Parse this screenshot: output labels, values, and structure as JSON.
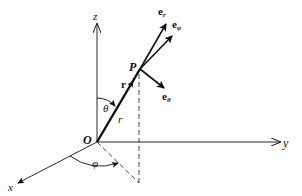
{
  "diagram": {
    "type": "spherical-coordinates",
    "axes": {
      "x": {
        "label": "x"
      },
      "y": {
        "label": "y"
      },
      "z": {
        "label": "z"
      }
    },
    "points": {
      "origin": {
        "label": "O"
      },
      "point": {
        "label": "P"
      }
    },
    "vectors": {
      "position": {
        "label": "r"
      },
      "radius_length": {
        "label": "r"
      },
      "e_r": {
        "base": "e",
        "sub": "r"
      },
      "e_phi": {
        "base": "e",
        "sub": "φ"
      },
      "e_theta": {
        "base": "e",
        "sub": "θ"
      }
    },
    "angles": {
      "theta": {
        "label": "θ"
      },
      "phi": {
        "label": "φ"
      }
    },
    "colors": {
      "line": "#111111",
      "background": "#ffffff"
    }
  }
}
